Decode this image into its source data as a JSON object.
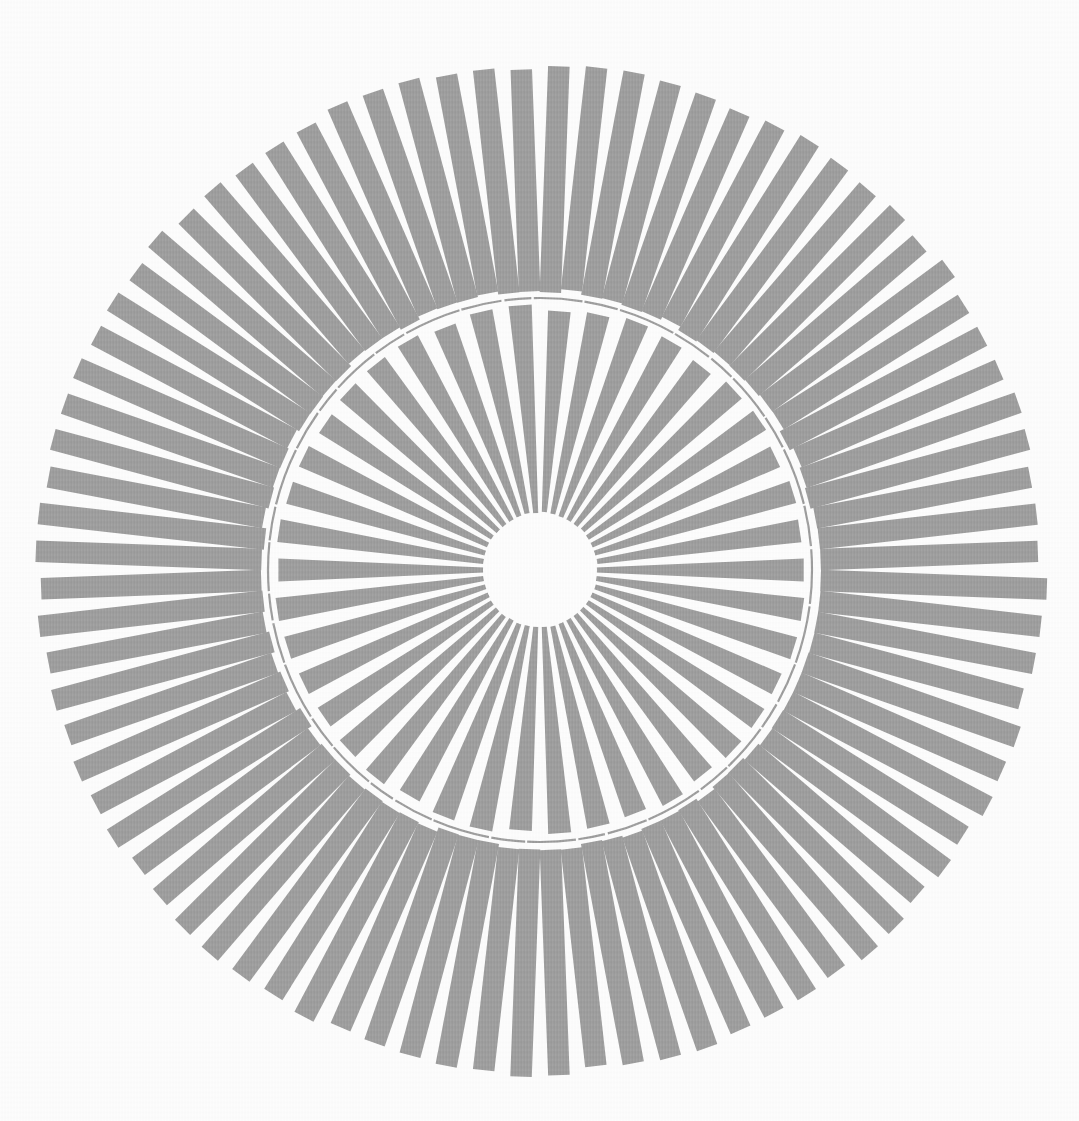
{
  "figure": {
    "kind": "radial-burst-illusion-plate",
    "canvas": {
      "width": 1079,
      "height": 1121
    },
    "background_color": "#fdfdfd",
    "ink_color": "#9b9b9b",
    "center": {
      "x": 540,
      "y": 570
    },
    "center_hole": {
      "radius": 57,
      "fill": "#fdfdfd"
    },
    "inner_disc": {
      "spoke_count": 42,
      "inner_radius": 57,
      "outer_radius": 263,
      "spoke_angular_width_deg": 5.0,
      "rotation_offset_deg": 4.286,
      "outer_end_jitter_px": 3.5
    },
    "divider_arc": {
      "radius": 272,
      "stroke_width": 2.2,
      "dash_pattern": [
        34,
        2.5,
        58,
        2,
        41,
        3,
        27,
        2.5,
        49,
        2
      ]
    },
    "outer_ring": {
      "spoke_count": 84,
      "inner_radius": 279,
      "outer_radius": 503,
      "spoke_bar_width_px": 21.5,
      "rotation_offset_deg": 2.143,
      "inner_end_jitter_px": 2.5,
      "outer_end_jitter_px": 5
    }
  }
}
